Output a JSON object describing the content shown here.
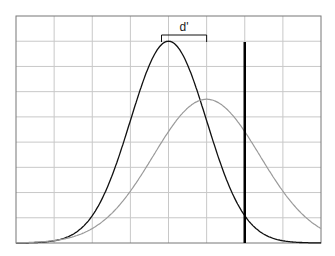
{
  "chart_data": {
    "type": "line",
    "title": "",
    "xlabel": "",
    "ylabel": "",
    "grid": true,
    "annotation": "d'",
    "xlim": [
      -4,
      4
    ],
    "ylim": [
      0,
      0.45
    ],
    "series": [
      {
        "name": "noise distribution",
        "color": "#111111",
        "mean": 0,
        "sd": 1.0,
        "peak": 0.4
      },
      {
        "name": "signal distribution",
        "color": "#9a9a9a",
        "mean": 1.0,
        "sd": 1.4,
        "peak": 0.285
      }
    ],
    "threshold": {
      "x": 2.0,
      "color": "#000000"
    },
    "d_prime_bracket": {
      "from": 0,
      "to": 1.0
    }
  },
  "labels": {
    "d_prime": "d'"
  }
}
